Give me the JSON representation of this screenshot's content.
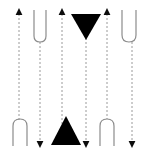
{
  "canvas": {
    "width": 154,
    "height": 152,
    "background": "#ffffff",
    "title": "tangle-diagram"
  },
  "style": {
    "strand_color": "#9a9a9a",
    "strand_width": 1,
    "dash_pattern": "2 2",
    "arc_color": "#8c8c8c",
    "arc_width": 1.2,
    "marker_fill": "#000000",
    "arrow_fill": "#0d0d0d"
  },
  "strands": [
    {
      "id": "strand-1",
      "x": 19,
      "y_top": 10,
      "y_bottom": 121,
      "dashed": true
    },
    {
      "id": "strand-2",
      "x": 40,
      "y_top": 42,
      "y_bottom": 146,
      "dashed": true
    },
    {
      "id": "strand-3",
      "x": 62,
      "y_top": 10,
      "y_bottom": 130,
      "dashed": true
    },
    {
      "id": "strand-4",
      "x": 86,
      "y_top": 34,
      "y_bottom": 146,
      "dashed": true
    },
    {
      "id": "strand-5",
      "x": 107,
      "y_top": 10,
      "y_bottom": 119,
      "dashed": true
    },
    {
      "id": "strand-6",
      "x": 132,
      "y_top": 42,
      "y_bottom": 146,
      "dashed": true
    }
  ],
  "arrows": [
    {
      "id": "arrow-up-1",
      "direction": "up",
      "x": 19,
      "y": 10,
      "size": 5
    },
    {
      "id": "arrow-up-2",
      "direction": "up",
      "x": 62,
      "y": 10,
      "size": 5
    },
    {
      "id": "arrow-up-3",
      "direction": "up",
      "x": 107,
      "y": 10,
      "size": 5
    },
    {
      "id": "arrow-down-1",
      "direction": "down",
      "x": 40,
      "y": 146,
      "size": 5
    },
    {
      "id": "arrow-down-2",
      "direction": "down",
      "x": 86,
      "y": 146,
      "size": 5
    },
    {
      "id": "arrow-down-3",
      "direction": "down",
      "x": 132,
      "y": 146,
      "size": 5
    }
  ],
  "arcs": [
    {
      "id": "cup-top-left",
      "orientation": "cup",
      "x_left": 34,
      "x_right": 46,
      "y_open": 10,
      "y_bottom": 42,
      "label": "U"
    },
    {
      "id": "cup-top-right",
      "orientation": "cup",
      "x_left": 122,
      "x_right": 136,
      "y_open": 10,
      "y_bottom": 42,
      "label": "U"
    },
    {
      "id": "cap-bottom-left",
      "orientation": "cap",
      "x_left": 13,
      "x_right": 27,
      "y_open": 146,
      "y_top": 119,
      "label": "n"
    },
    {
      "id": "cap-bottom-right",
      "orientation": "cap",
      "x_left": 100,
      "x_right": 114,
      "y_open": 146,
      "y_top": 119,
      "label": "n"
    }
  ],
  "triangles": [
    {
      "id": "triangle-down",
      "direction": "down",
      "apex_x": 86,
      "apex_y": 40,
      "base_y": 14,
      "half_width": 15,
      "fill": "#000000"
    },
    {
      "id": "triangle-up",
      "direction": "up",
      "apex_x": 66,
      "apex_y": 116,
      "base_y": 145,
      "half_width": 15,
      "fill": "#000000"
    }
  ]
}
